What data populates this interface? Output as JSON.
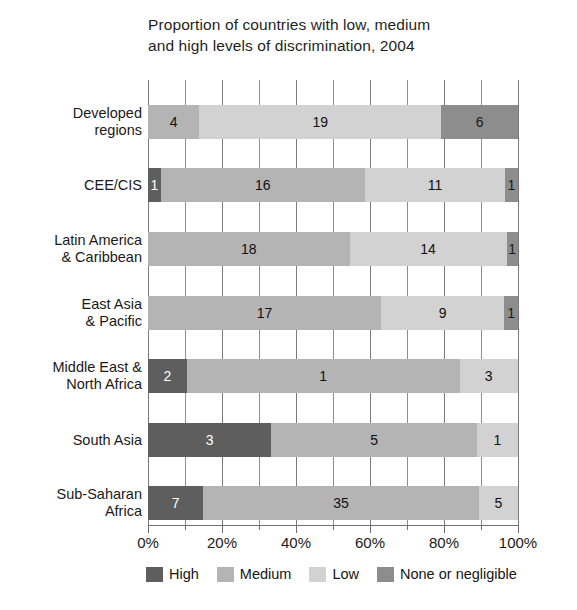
{
  "chart_data": {
    "type": "bar",
    "orientation": "horizontal",
    "stacked": true,
    "stack_mode": "percent",
    "title": "Proportion of countries with low, medium and high levels of discrimination, 2004",
    "title_lines": [
      "Proportion of countries with low, medium",
      "and high levels of discrimination, 2004"
    ],
    "xlabel": "",
    "ylabel": "",
    "xlim": [
      0,
      100
    ],
    "xtick_labels": [
      "0%",
      "20%",
      "40%",
      "60%",
      "80%",
      "100%"
    ],
    "xtick_values": [
      0,
      20,
      40,
      60,
      80,
      100
    ],
    "xtick_minor_values": [
      10,
      30,
      50,
      70,
      90
    ],
    "grid": true,
    "legend_position": "bottom",
    "categories": [
      "Developed regions",
      "CEE/CIS",
      "Latin America & Caribbean",
      "East Asia & Pacific",
      "Middle East & North Africa",
      "South Asia",
      "Sub-Saharan Africa"
    ],
    "category_lines": [
      [
        "Developed",
        "regions"
      ],
      [
        "CEE/CIS"
      ],
      [
        "Latin America",
        "& Caribbean"
      ],
      [
        "East Asia",
        "& Pacific"
      ],
      [
        "Middle East &",
        "North Africa"
      ],
      [
        "South Asia"
      ],
      [
        "Sub-Saharan",
        "Africa"
      ]
    ],
    "series": [
      {
        "name": "High",
        "key": "high",
        "color": "#5e5e5e",
        "values": [
          0,
          1,
          0,
          0,
          2,
          3,
          7
        ]
      },
      {
        "name": "Medium",
        "key": "medium",
        "color": "#b4b4b4",
        "values": [
          4,
          16,
          18,
          17,
          1,
          5,
          35
        ]
      },
      {
        "name": "Low",
        "key": "low",
        "color": "#d2d2d2",
        "values": [
          19,
          11,
          14,
          9,
          3,
          1,
          5
        ]
      },
      {
        "name": "None or negligible",
        "key": "none",
        "color": "#8d8d8d",
        "values": [
          6,
          1,
          1,
          1,
          0,
          0,
          0
        ]
      }
    ],
    "rows": [
      {
        "category": "Developed regions",
        "total": 29,
        "segments": [
          {
            "key": "medium",
            "label": "4",
            "value": 4,
            "percent": 13.8
          },
          {
            "key": "low",
            "label": "19",
            "value": 19,
            "percent": 65.5
          },
          {
            "key": "none",
            "label": "6",
            "value": 6,
            "percent": 20.7
          }
        ]
      },
      {
        "category": "CEE/CIS",
        "total": 29,
        "segments": [
          {
            "key": "high",
            "label": "1",
            "value": 1,
            "percent": 3.4
          },
          {
            "key": "medium",
            "label": "16",
            "value": 16,
            "percent": 55.2
          },
          {
            "key": "low",
            "label": "11",
            "value": 11,
            "percent": 37.9
          },
          {
            "key": "none",
            "label": "1",
            "value": 1,
            "percent": 3.5
          }
        ]
      },
      {
        "category": "Latin America & Caribbean",
        "total": 33,
        "segments": [
          {
            "key": "medium",
            "label": "18",
            "value": 18,
            "percent": 54.5
          },
          {
            "key": "low",
            "label": "14",
            "value": 14,
            "percent": 42.4
          },
          {
            "key": "none",
            "label": "1",
            "value": 1,
            "percent": 3.1
          }
        ]
      },
      {
        "category": "East Asia & Pacific",
        "total": 27,
        "segments": [
          {
            "key": "medium",
            "label": "17",
            "value": 17,
            "percent": 63.0
          },
          {
            "key": "low",
            "label": "9",
            "value": 9,
            "percent": 33.3
          },
          {
            "key": "none",
            "label": "1",
            "value": 1,
            "percent": 3.7
          }
        ]
      },
      {
        "category": "Middle East & North Africa",
        "total": 19,
        "segments": [
          {
            "key": "high",
            "label": "2",
            "value": 2,
            "percent": 10.5
          },
          {
            "key": "medium",
            "label": "1",
            "value": 14,
            "percent": 73.7
          },
          {
            "key": "low",
            "label": "3",
            "value": 3,
            "percent": 15.8
          }
        ]
      },
      {
        "category": "South Asia",
        "total": 9,
        "segments": [
          {
            "key": "high",
            "label": "3",
            "value": 3,
            "percent": 33.3
          },
          {
            "key": "medium",
            "label": "5",
            "value": 5,
            "percent": 55.6
          },
          {
            "key": "low",
            "label": "1",
            "value": 1,
            "percent": 11.1
          }
        ]
      },
      {
        "category": "Sub-Saharan Africa",
        "total": 47,
        "segments": [
          {
            "key": "high",
            "label": "7",
            "value": 7,
            "percent": 14.9
          },
          {
            "key": "medium",
            "label": "35",
            "value": 35,
            "percent": 74.5
          },
          {
            "key": "low",
            "label": "5",
            "value": 5,
            "percent": 10.6
          }
        ]
      }
    ],
    "legend": [
      {
        "label": "High",
        "key": "high",
        "color": "#5e5e5e"
      },
      {
        "label": "Medium",
        "key": "medium",
        "color": "#b4b4b4"
      },
      {
        "label": "Low",
        "key": "low",
        "color": "#d2d2d2"
      },
      {
        "label": "None or negligible",
        "key": "none",
        "color": "#8d8d8d"
      }
    ]
  }
}
